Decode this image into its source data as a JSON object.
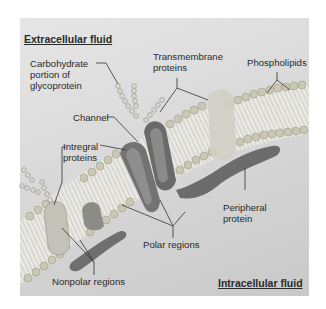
{
  "diagram": {
    "type": "cell-membrane-structure",
    "regions": {
      "top": "Extracellular fluid",
      "bottom": "Intracellular fluid"
    },
    "labels": {
      "carbohydrate": [
        "Carbohydrate",
        "portion of",
        "glycoprotein"
      ],
      "transmembrane": [
        "Transmembrane",
        "proteins"
      ],
      "phospholipids": "Phospholipids",
      "channel": "Channel",
      "integral": [
        "Intregral",
        "proteins"
      ],
      "peripheral": [
        "Peripheral",
        "protein"
      ],
      "polar": "Polar regions",
      "nonpolar": "Nonpolar regions"
    },
    "colors": {
      "background": "#d8d8d8",
      "lipid_head": "#c9c8b4",
      "lipid_tail": "#ececec",
      "protein_dark": "#6e6e6e",
      "protein_mid": "#8a8a8a",
      "protein_light": "#cfcfc4",
      "leader_line": "#333333"
    }
  }
}
